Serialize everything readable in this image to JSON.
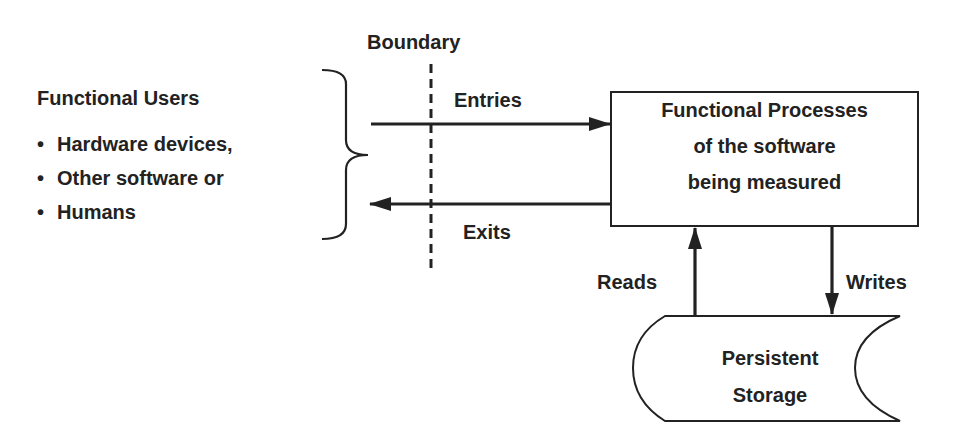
{
  "diagram": {
    "boundary_label": "Boundary",
    "functional_users": {
      "title": "Functional Users",
      "items": [
        {
          "bullet": "•",
          "label": "Hardware devices,"
        },
        {
          "bullet": "•",
          "label": "Other software or"
        },
        {
          "bullet": "•",
          "label": "Humans"
        }
      ]
    },
    "flows": {
      "entries": "Entries",
      "exits": "Exits",
      "reads": "Reads",
      "writes": "Writes"
    },
    "process_box": {
      "lines": [
        "Functional Processes",
        "of the software",
        "being measured"
      ]
    },
    "storage": {
      "lines": [
        "Persistent",
        "Storage"
      ]
    },
    "colors": {
      "ink": "#222222",
      "background": "#ffffff"
    }
  }
}
